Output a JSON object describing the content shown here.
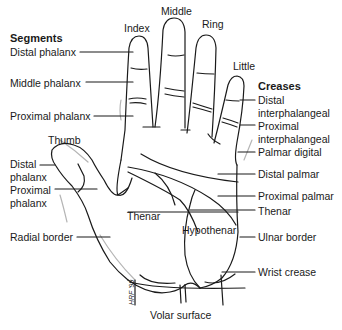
{
  "diagram": {
    "type": "anatomical-illustration",
    "caption": "Volar surface",
    "signature": "HRF '99",
    "colors": {
      "line": "#1a1a1a",
      "shadow": "#b5b5b5",
      "background": "#ffffff"
    },
    "fingers": {
      "index": "Index",
      "middle": "Middle",
      "ring": "Ring",
      "little": "Little",
      "thumb": "Thumb"
    },
    "segments": {
      "heading": "Segments",
      "distal_phalanx": "Distal phalanx",
      "middle_phalanx": "Middle phalanx",
      "proximal_phalanx": "Proximal phalanx",
      "thumb_distal_1": "Distal",
      "thumb_distal_2": "phalanx",
      "thumb_proximal_1": "Proximal",
      "thumb_proximal_2": "phalanx"
    },
    "creases": {
      "heading": "Creases",
      "distal_ip_1": "Distal",
      "distal_ip_2": "interphalangeal",
      "proximal_ip_1": "Proximal",
      "proximal_ip_2": "interphalangeal",
      "palmar_digital": "Palmar digital",
      "distal_palmar": "Distal palmar",
      "proximal_palmar": "Proximal palmar",
      "thenar": "Thenar",
      "wrist_crease": "Wrist crease"
    },
    "regions": {
      "thenar": "Thenar",
      "hypothenar": "Hypothenar"
    },
    "borders": {
      "radial": "Radial border",
      "ulnar": "Ulnar border"
    }
  }
}
